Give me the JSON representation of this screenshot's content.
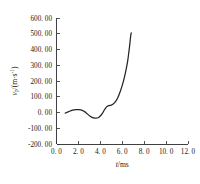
{
  "chart_data": {
    "type": "line",
    "title": "",
    "subtitle": "",
    "xlabel": "t/ms",
    "ylabel": "v_p/(m·s⁻¹)",
    "ylabel_parts": {
      "symbol": "v",
      "subscript": "p",
      "unit_prefix": "/(m·s",
      "unit_sup": "-1",
      "unit_suffix": ")"
    },
    "xlabel_parts": {
      "symbol": "t",
      "unit": "/ms"
    },
    "xlim": [
      0.0,
      12.0
    ],
    "ylim": [
      -200.0,
      600.0
    ],
    "xticks": [
      0.0,
      2.0,
      4.0,
      6.0,
      8.0,
      10.0,
      12.0
    ],
    "yticks": [
      -200.0,
      -100.0,
      0.0,
      100.0,
      200.0,
      300.0,
      400.0,
      500.0,
      600.0
    ],
    "xtick_labels": [
      "0. 0",
      "2. 0",
      "4. 0",
      "6. 0",
      "8. 0",
      "10. 0",
      "12. 0"
    ],
    "ytick_labels": [
      "-200. 00",
      "-100. 00",
      "0. 00",
      "100. 00",
      "200. 00",
      "300. 00",
      "400. 00",
      "500. 00",
      "600. 00"
    ],
    "grid": false,
    "legend": false,
    "legend_position": "none",
    "line_color": "#242424",
    "background_color": "#ffffff",
    "axis_color": "#2b2b2b",
    "spines_visible": [
      "left",
      "bottom"
    ],
    "tick_direction": "in",
    "series": [
      {
        "name": "particle velocity",
        "color": "#242424",
        "x": [
          0.8,
          1.0,
          1.2,
          1.4,
          1.6,
          1.8,
          2.0,
          2.2,
          2.4,
          2.6,
          2.8,
          3.0,
          3.2,
          3.4,
          3.6,
          3.8,
          4.0,
          4.2,
          4.35,
          4.5,
          4.65,
          4.8,
          5.0,
          5.2,
          5.4,
          5.6,
          5.8,
          6.0,
          6.2,
          6.35,
          6.5,
          6.6,
          6.68,
          6.74,
          6.78,
          6.82
        ],
        "y": [
          -4,
          2,
          8,
          13,
          16,
          18,
          18,
          17,
          12,
          4,
          -8,
          -20,
          -29,
          -34,
          -36,
          -33,
          -22,
          -4,
          14,
          30,
          40,
          44,
          47,
          55,
          70,
          95,
          130,
          172,
          225,
          272,
          330,
          382,
          428,
          468,
          492,
          506
        ]
      }
    ],
    "annotations": []
  }
}
